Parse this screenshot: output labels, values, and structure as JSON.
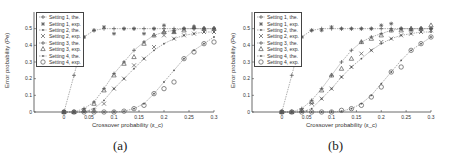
{
  "chart_data": [
    {
      "type": "line",
      "panel": "(a)",
      "title": "",
      "xlabel": "Crossover probability (ε_c)",
      "ylabel": "Error probability (Pe)",
      "xlim": [
        -0.06,
        0.3
      ],
      "ylim": [
        0,
        0.6
      ],
      "xticks": [
        0,
        0.05,
        0.1,
        0.15,
        0.2,
        0.25,
        0.3
      ],
      "xtick_labels": [
        "0",
        "0.05",
        "0.1",
        "0.15",
        "0.2",
        "0.25",
        "0.3"
      ],
      "yticks": [
        0,
        0.1,
        0.2,
        0.3,
        0.4,
        0.5
      ],
      "ytick_labels": [
        "0",
        "0.1",
        "0.2",
        "0.3",
        "0.4",
        "0.5"
      ],
      "grid": false,
      "legend_position": "upper left",
      "x": [
        0,
        0.02,
        0.04,
        0.06,
        0.08,
        0.1,
        0.12,
        0.14,
        0.16,
        0.18,
        0.2,
        0.22,
        0.24,
        0.26,
        0.28,
        0.3
      ],
      "series": [
        {
          "name": "Setting 1, the.",
          "marker": "plus",
          "line": true,
          "values": [
            0,
            0.22,
            0.45,
            0.49,
            0.5,
            0.5,
            0.5,
            0.5,
            0.5,
            0.5,
            0.5,
            0.5,
            0.5,
            0.5,
            0.5,
            0.5
          ]
        },
        {
          "name": "Setting 1, exp.",
          "marker": "asterisk",
          "line": false,
          "values": [
            0,
            null,
            0.45,
            0.49,
            0.51,
            0.47,
            0.5,
            0.5,
            0.47,
            0.5,
            0.52,
            0.48,
            0.5,
            0.51,
            0.5,
            0.5
          ]
        },
        {
          "name": "Setting 2, the.",
          "marker": "dot",
          "line": true,
          "values": [
            0,
            0,
            0,
            0.02,
            0.07,
            0.14,
            0.2,
            0.26,
            0.32,
            0.37,
            0.41,
            0.44,
            0.46,
            0.47,
            0.48,
            0.48
          ]
        },
        {
          "name": "Setting 2, exp.",
          "marker": "x",
          "line": false,
          "values": [
            0,
            0,
            0.01,
            0.01,
            0.05,
            0.14,
            0.2,
            0.28,
            0.32,
            0.39,
            0.46,
            0.44,
            0.46,
            0.47,
            0.48,
            0.48
          ]
        },
        {
          "name": "Setting 3, the.",
          "marker": "plus",
          "line": true,
          "values": [
            0,
            0,
            0.02,
            0.06,
            0.14,
            0.23,
            0.3,
            0.37,
            0.42,
            0.46,
            0.48,
            0.49,
            0.5,
            0.5,
            0.5,
            0.5
          ]
        },
        {
          "name": "Setting 3, exp.",
          "marker": "triangle",
          "line": false,
          "values": [
            0,
            0,
            0.01,
            0.05,
            0.13,
            0.22,
            0.29,
            0.33,
            0.41,
            0.46,
            0.48,
            0.48,
            0.49,
            0.51,
            0.5,
            0.5
          ]
        },
        {
          "name": "Setting 4, the.",
          "marker": "dot",
          "line": true,
          "values": [
            0,
            0,
            0,
            0,
            0,
            0,
            0.005,
            0.02,
            0.05,
            0.11,
            0.18,
            0.25,
            0.32,
            0.37,
            0.41,
            0.45
          ]
        },
        {
          "name": "Setting 4, exp.",
          "marker": "circle",
          "line": false,
          "values": [
            0,
            0,
            0,
            0,
            0,
            0,
            0.005,
            0.02,
            0.04,
            0.11,
            0.14,
            0.18,
            0.32,
            0.36,
            0.41,
            0.42
          ]
        }
      ],
      "legend": [
        "Setting 1, the.",
        "Setting 1, exp.",
        "Setting 2, the.",
        "Setting 2, exp.",
        "Setting 3, the.",
        "Setting 3, exp.",
        "Setting 4, the.",
        "Setting 4, exp."
      ]
    },
    {
      "type": "line",
      "panel": "(b)",
      "title": "",
      "xlabel": "Crossover probability (ε_c)",
      "ylabel": "Error probability (Pe)",
      "xlim": [
        -0.06,
        0.3
      ],
      "ylim": [
        0,
        0.6
      ],
      "xticks": [
        0,
        0.05,
        0.1,
        0.15,
        0.2,
        0.25,
        0.3
      ],
      "xtick_labels": [
        "0",
        "0.05",
        "0.1",
        "0.15",
        "0.2",
        "0.25",
        "0.3"
      ],
      "yticks": [
        0,
        0.1,
        0.2,
        0.3,
        0.4,
        0.5
      ],
      "ytick_labels": [
        "0",
        "0.1",
        "0.2",
        "0.3",
        "0.4",
        "0.5"
      ],
      "grid": false,
      "legend_position": "upper left",
      "x": [
        0,
        0.02,
        0.04,
        0.06,
        0.08,
        0.1,
        0.12,
        0.14,
        0.16,
        0.18,
        0.2,
        0.22,
        0.24,
        0.26,
        0.28,
        0.3
      ],
      "series": [
        {
          "name": "Setting 1, the.",
          "marker": "plus",
          "line": true,
          "values": [
            0,
            0.22,
            0.45,
            0.49,
            0.5,
            0.5,
            0.5,
            0.5,
            0.5,
            0.5,
            0.5,
            0.5,
            0.5,
            0.5,
            0.5,
            0.5
          ]
        },
        {
          "name": "Setting 1, exp.",
          "marker": "asterisk",
          "line": false,
          "values": [
            0,
            null,
            0.45,
            0.49,
            0.49,
            0.51,
            0.5,
            0.5,
            0.5,
            0.5,
            0.52,
            0.53,
            0.5,
            0.49,
            0.5,
            0.5
          ]
        },
        {
          "name": "Setting 2, the.",
          "marker": "dot",
          "line": true,
          "values": [
            0,
            0,
            0,
            0.02,
            0.08,
            0.14,
            0.21,
            0.27,
            0.32,
            0.37,
            0.41,
            0.44,
            0.46,
            0.47,
            0.48,
            0.48
          ]
        },
        {
          "name": "Setting 2, exp.",
          "marker": "x",
          "line": false,
          "values": [
            0,
            0,
            0.01,
            0.05,
            0.08,
            0.14,
            0.21,
            0.27,
            0.35,
            0.37,
            0.42,
            0.44,
            0.46,
            0.47,
            0.48,
            0.49
          ]
        },
        {
          "name": "Setting 3, the.",
          "marker": "plus",
          "line": true,
          "values": [
            0,
            0,
            0.02,
            0.07,
            0.14,
            0.22,
            0.3,
            0.37,
            0.42,
            0.45,
            0.47,
            0.49,
            0.5,
            0.5,
            0.5,
            0.5
          ]
        },
        {
          "name": "Setting 3, exp.",
          "marker": "triangle",
          "line": false,
          "values": [
            0,
            0,
            0.01,
            0.06,
            0.13,
            0.22,
            0.26,
            0.32,
            0.42,
            0.44,
            0.46,
            0.49,
            0.49,
            0.5,
            0.5,
            0.52
          ]
        },
        {
          "name": "Setting 4, the.",
          "marker": "dot",
          "line": true,
          "values": [
            0,
            0,
            0,
            0,
            0,
            0,
            0.005,
            0.02,
            0.05,
            0.1,
            0.17,
            0.24,
            0.31,
            0.37,
            0.41,
            0.45
          ]
        },
        {
          "name": "Setting 4, exp.",
          "marker": "circle",
          "line": false,
          "values": [
            0,
            0,
            0,
            0,
            0,
            0,
            0.01,
            0.02,
            0.04,
            0.09,
            0.15,
            0.24,
            0.27,
            0.37,
            0.41,
            0.45
          ]
        }
      ],
      "legend": [
        "Setting 1, the.",
        "Setting 1, exp.",
        "Setting 2, the.",
        "Setting 2, exp.",
        "Setting 3, the.",
        "Setting 3, exp.",
        "Setting 4, the.",
        "Setting 4, exp."
      ]
    }
  ],
  "panels": [
    {
      "caption": "(a)",
      "xlabel": "Crossover probability (ε_c)",
      "ylabel": "Error probability (Pe)"
    },
    {
      "caption": "(b)",
      "xlabel": "Crossover probability (ε_c)",
      "ylabel": "Error probability (Pe)"
    }
  ],
  "colors": {
    "axis": "#444444",
    "line": "#777777",
    "marker": "#555555",
    "text": "#333333"
  }
}
